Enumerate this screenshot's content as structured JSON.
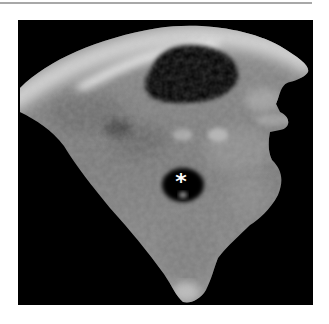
{
  "figure": {
    "type": "ultrasound-image",
    "marker_label": "*",
    "colors": {
      "background": "#ffffff",
      "panel": "#000000",
      "rule": "#a8a8a8",
      "marker": "#ffffff"
    }
  }
}
